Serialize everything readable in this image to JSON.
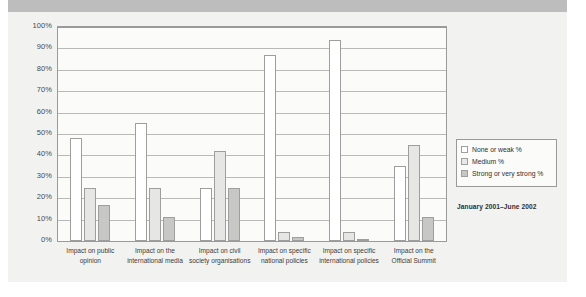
{
  "chart_data": {
    "type": "bar",
    "title": "",
    "xlabel": "",
    "ylabel": "",
    "ylim": [
      0,
      100
    ],
    "grid": true,
    "legend_position": "right",
    "annotation": "January 2001–June 2002",
    "categories": [
      "Impact on public opinion",
      "Impact on the international media",
      "Impact on civil society organisations",
      "Impact on specific national policies",
      "Impact on specific international policies",
      "Impact on the Official Summit"
    ],
    "category_lines": [
      [
        "Impact on public",
        "opinion"
      ],
      [
        "Impact on the",
        "international media"
      ],
      [
        "Impact on civil",
        "society organisations"
      ],
      [
        "Impact on specific",
        "national policies"
      ],
      [
        "Impact on specific",
        "international policies"
      ],
      [
        "Impact on the",
        "Official Summit"
      ]
    ],
    "series": [
      {
        "name": "None or weak %",
        "color": "#ffffff",
        "values": [
          48,
          55,
          25,
          87,
          94,
          35
        ]
      },
      {
        "name": "Medium %",
        "color": "#e6e6e4",
        "values": [
          25,
          25,
          42,
          4,
          4,
          45
        ]
      },
      {
        "name": "Strong or very strong %",
        "color": "#c7c7c5",
        "values": [
          17,
          11,
          25,
          2,
          1,
          11
        ]
      }
    ],
    "yticks": [
      "0%",
      "10%",
      "20%",
      "30%",
      "40%",
      "50%",
      "60%",
      "70%",
      "80%",
      "90%",
      "100%"
    ],
    "ytick_values": [
      0,
      10,
      20,
      30,
      40,
      50,
      60,
      70,
      80,
      90,
      100
    ]
  },
  "legend": {
    "items": [
      {
        "label": "None or weak %",
        "swatch": "s0"
      },
      {
        "label": "Medium %",
        "swatch": "s1"
      },
      {
        "label": "Strong or very strong %",
        "swatch": "s2"
      }
    ]
  },
  "date_range": "January 2001–June 2002"
}
